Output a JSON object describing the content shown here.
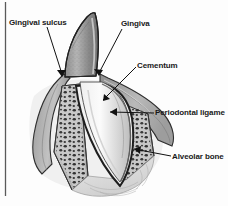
{
  "figure": {
    "type": "anatomical-illustration",
    "background_color": "#fdfdfd",
    "border_color": "#5a5a5a",
    "label_color": "#191919"
  },
  "labels": [
    {
      "id": "gingival-sulcus",
      "text": "Gingival sulcus"
    },
    {
      "id": "gingiva",
      "text": "Gingiva"
    },
    {
      "id": "cementum",
      "text": "Cementum"
    },
    {
      "id": "periodontal-ligament",
      "text": "Periodontal ligame"
    },
    {
      "id": "alveolar-bone",
      "text": "Alveolar bone"
    }
  ]
}
